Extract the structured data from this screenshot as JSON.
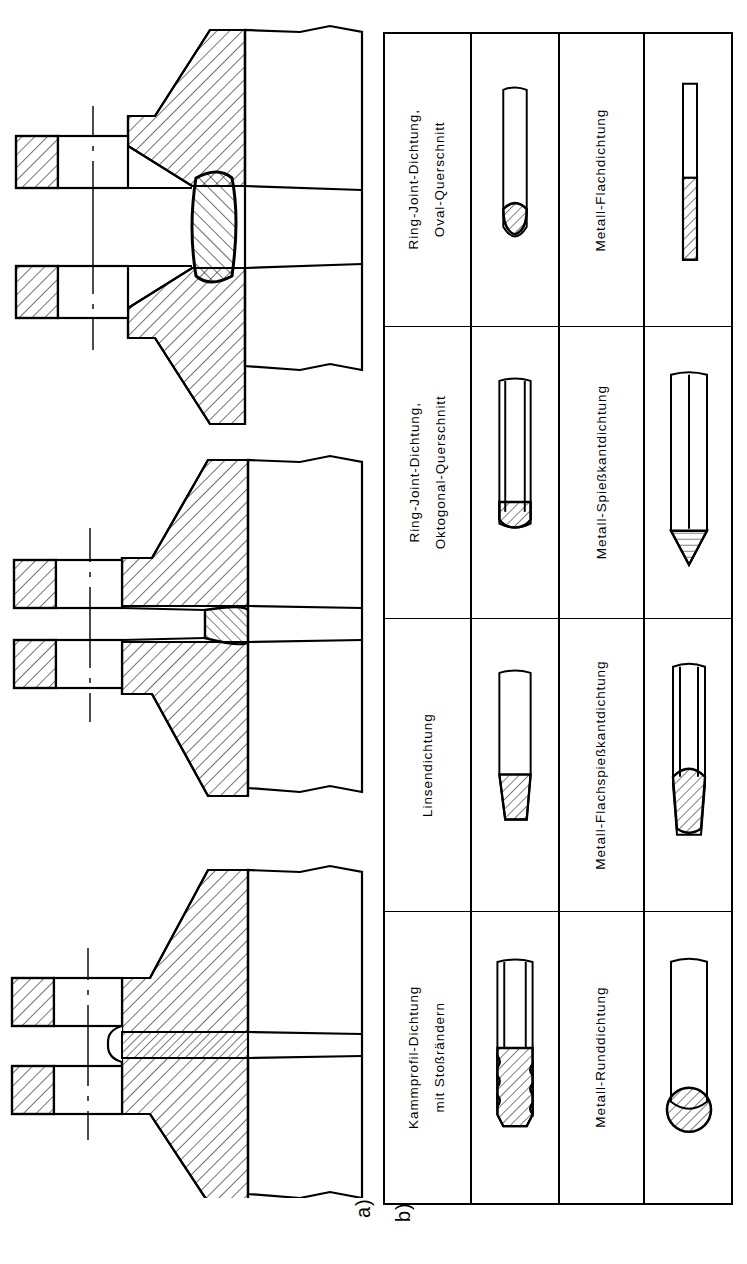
{
  "figure": {
    "captions": {
      "part_a": "a)",
      "part_b": "b)"
    },
    "line_color": "#000000",
    "background": "#ffffff"
  },
  "part_a": {
    "name": "flange-connection-cross-sections",
    "items": [
      {
        "id": "flange-ring-joint-oval",
        "gasket": "oval ring-joint gasket"
      },
      {
        "id": "flange-lens",
        "gasket": "lens gasket"
      },
      {
        "id": "flange-flat",
        "gasket": "flat metal gasket"
      }
    ]
  },
  "part_b": {
    "name": "gasket-types-table",
    "columns": [
      {
        "key": "labels_left",
        "type": "label"
      },
      {
        "key": "shapes_left",
        "type": "drawing"
      },
      {
        "key": "labels_right",
        "type": "label"
      },
      {
        "key": "shapes_right",
        "type": "drawing"
      }
    ],
    "rows": [
      {
        "left_label_line1": "Metall-Flachdichtung",
        "left_label_line2": "",
        "left_shape": "flat-strip-gasket",
        "right_label_line1": "Ring-Joint-Dichtung,",
        "right_label_line2": "Oval-Querschnitt",
        "right_shape": "oval-ring-joint-gasket"
      },
      {
        "left_label_line1": "Metall-Spießkantdichtung",
        "left_label_line2": "",
        "left_shape": "pointed-edge-gasket",
        "right_label_line1": "Ring-Joint-Dichtung,",
        "right_label_line2": "Oktogonal-Querschnitt",
        "right_shape": "octagonal-ring-joint-gasket"
      },
      {
        "left_label_line1": "Metall-Flachspießkantdichtung",
        "left_label_line2": "",
        "left_shape": "flat-pointed-edge-gasket",
        "right_label_line1": "Linsendichtung",
        "right_label_line2": "",
        "right_shape": "lens-gasket"
      },
      {
        "left_label_line1": "Metall-Runddichtung",
        "left_label_line2": "",
        "left_shape": "round-gasket",
        "right_label_line1": "Kammprofil-Dichtung",
        "right_label_line2": "mit Stoßrändern",
        "right_shape": "kammprofil-gasket"
      }
    ]
  }
}
